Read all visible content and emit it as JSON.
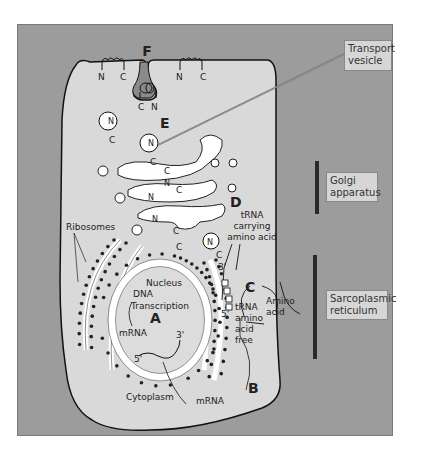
{
  "diagram": {
    "panel_color": "#9c9c9c",
    "cell_color": "#d9d9d9",
    "stage_labels": [
      "A",
      "B",
      "C",
      "D",
      "E",
      "F"
    ],
    "callouts": {
      "transport_vesicle": [
        "Transport",
        "vesicle"
      ],
      "golgi": [
        "Golgi",
        "apparatus"
      ],
      "sarcoplasmic": [
        "Sarcoplasmic",
        "reticulum"
      ]
    },
    "labels": {
      "ribosomes": "Ribosomes",
      "nucleus": "Nucleus",
      "dna": "DNA",
      "transcription": "Transcription",
      "mrna_nucleus": "mRNA",
      "five_prime_nucleus": "5'",
      "three_prime_nucleus": "3'",
      "cytoplasm": "Cytoplasm",
      "mrna_cytoplasm": "mRNA",
      "trna_carrying": [
        "tRNA",
        "carrying",
        "amino acid"
      ],
      "trna_free": [
        "tRNA",
        "amino",
        "acid",
        "free"
      ],
      "amino_acid": [
        "Amino",
        "acid"
      ],
      "three_prime_er": "3'",
      "five_prime_er": "5'",
      "n": "N",
      "c": "C"
    }
  }
}
